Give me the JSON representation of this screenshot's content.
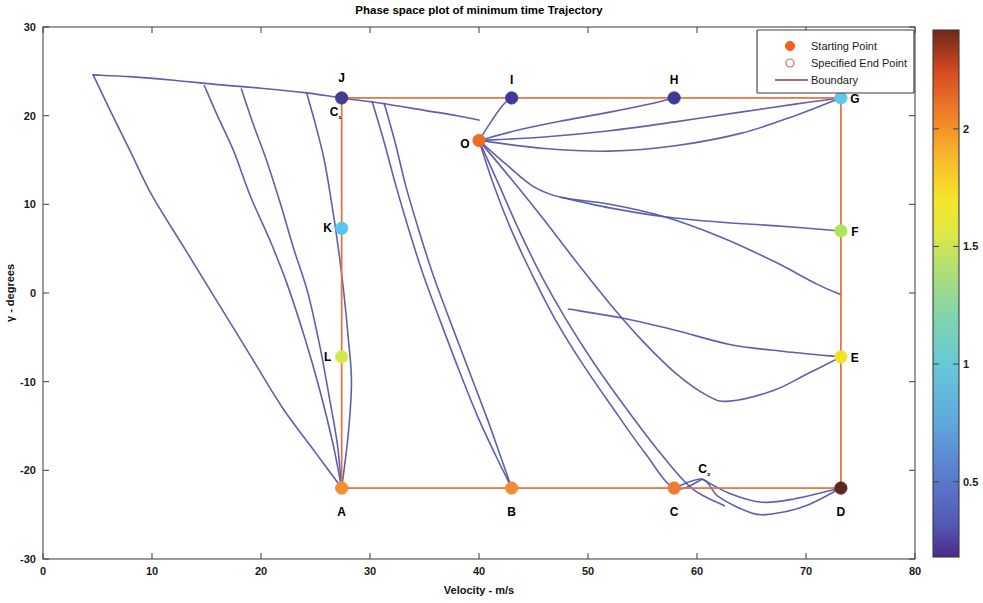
{
  "chart_data": {
    "type": "line",
    "title": "Phase space plot of minimum time Trajectory",
    "xlabel": "Velocity - m/s",
    "ylabel": "γ - degrees",
    "xlim": [
      0,
      80
    ],
    "ylim": [
      -30,
      30
    ],
    "xticks": [
      0,
      10,
      20,
      30,
      40,
      50,
      60,
      70,
      80
    ],
    "yticks": [
      -30,
      -20,
      -10,
      0,
      10,
      20,
      30
    ],
    "xticklabels": [
      "0",
      "10",
      "20",
      "30",
      "40",
      "50",
      "60",
      "70",
      "80"
    ],
    "yticklabels": [
      "-30",
      "-20",
      "-10",
      "0",
      "10",
      "20",
      "30"
    ],
    "grid": false,
    "legend": {
      "position": "top-right",
      "entries": [
        {
          "label": "Starting Point",
          "marker": "filled-circle",
          "color": "#f4601e"
        },
        {
          "label": "Specified End Point",
          "marker": "open-circle",
          "color": "#c86a5a"
        },
        {
          "label": "Boundary",
          "marker": "line",
          "color": "#8b4034"
        }
      ]
    },
    "colorbar": {
      "colormap": "jet",
      "vmin": 0.18,
      "vmax": 2.42,
      "ticks": [
        0.5,
        1,
        1.5,
        2
      ],
      "ticklabels": [
        "0.5",
        "1",
        "1.5",
        "2"
      ],
      "label": ""
    },
    "boundary": {
      "color": "#e8703a",
      "x": [
        27.4,
        73.2
      ],
      "y": [
        -22.0,
        22.0
      ],
      "description": "rectangular boundary from (27.4,-22) to (73.2,22)"
    },
    "annotated_points": [
      {
        "label": "A",
        "x": 27.4,
        "y": -22.0,
        "color": "#f3912e",
        "kind": "starting"
      },
      {
        "label": "B",
        "x": 43.0,
        "y": -22.0,
        "color": "#f08b36",
        "kind": "starting"
      },
      {
        "label": "C",
        "x": 57.9,
        "y": -22.0,
        "color": "#ef7a33",
        "kind": "starting"
      },
      {
        "label": "D",
        "x": 73.2,
        "y": -22.0,
        "color": "#5a2a1c",
        "kind": "end"
      },
      {
        "label": "E",
        "x": 73.2,
        "y": -7.2,
        "color": "#f2e222",
        "kind": "end"
      },
      {
        "label": "F",
        "x": 73.2,
        "y": 7.0,
        "color": "#aee35a",
        "kind": "end"
      },
      {
        "label": "G",
        "x": 73.2,
        "y": 22.0,
        "color": "#5fc7ec",
        "kind": "end"
      },
      {
        "label": "H",
        "x": 57.9,
        "y": 22.0,
        "color": "#3b3a9c",
        "kind": "end"
      },
      {
        "label": "I",
        "x": 43.0,
        "y": 22.0,
        "color": "#3b3a9c",
        "kind": "end"
      },
      {
        "label": "J",
        "x": 27.4,
        "y": 22.0,
        "color": "#3f3d96",
        "kind": "end"
      },
      {
        "label": "K",
        "x": 27.4,
        "y": 7.3,
        "color": "#54c6ef",
        "kind": "end"
      },
      {
        "label": "L",
        "x": 27.4,
        "y": -7.2,
        "color": "#cfe84a",
        "kind": "end"
      },
      {
        "label": "O",
        "x": 40.0,
        "y": 17.2,
        "color": "#ef6a22",
        "kind": "starting"
      },
      {
        "label": "C₁",
        "x": 27.4,
        "y": 22.0,
        "color": "#3f3d96",
        "kind": "corner-annotation"
      },
      {
        "label": "C₂",
        "x": 60.5,
        "y": -21.0,
        "color": "#ef7a33",
        "kind": "corner-annotation"
      }
    ],
    "trajectory_color": "#4f54a8",
    "trajectories": [
      {
        "name": "upper-envelope-to-J",
        "points": [
          [
            4.6,
            24.6
          ],
          [
            8,
            24.4
          ],
          [
            12,
            24.0
          ],
          [
            16,
            23.5
          ],
          [
            20,
            23.1
          ],
          [
            24,
            22.6
          ],
          [
            27.4,
            22.0
          ],
          [
            31,
            21.4
          ],
          [
            35,
            20.6
          ],
          [
            38,
            20.0
          ],
          [
            40,
            19.5
          ]
        ]
      },
      {
        "name": "A-fan-1",
        "points": [
          [
            4.6,
            24.6
          ],
          [
            6,
            21
          ],
          [
            8,
            16
          ],
          [
            10,
            11
          ],
          [
            13,
            5
          ],
          [
            16,
            -1
          ],
          [
            19,
            -7
          ],
          [
            22,
            -13
          ],
          [
            25,
            -18
          ],
          [
            27.4,
            -22.0
          ]
        ]
      },
      {
        "name": "A-fan-2",
        "points": [
          [
            14.8,
            23.4
          ],
          [
            16,
            20
          ],
          [
            17.5,
            16
          ],
          [
            19,
            11
          ],
          [
            20.8,
            6
          ],
          [
            22.4,
            1
          ],
          [
            24,
            -5
          ],
          [
            25.4,
            -11
          ],
          [
            26.6,
            -17
          ],
          [
            27.4,
            -22.0
          ]
        ]
      },
      {
        "name": "A-fan-3",
        "points": [
          [
            18.2,
            23.0
          ],
          [
            19.3,
            19
          ],
          [
            20.5,
            15
          ],
          [
            21.8,
            10
          ],
          [
            23,
            5
          ],
          [
            24.3,
            0
          ],
          [
            25.4,
            -6
          ],
          [
            26.3,
            -12
          ],
          [
            27.0,
            -17
          ],
          [
            27.4,
            -22.0
          ]
        ]
      },
      {
        "name": "A-fan-4",
        "points": [
          [
            24.2,
            22.5
          ],
          [
            25,
            19
          ],
          [
            25.8,
            15
          ],
          [
            26.5,
            10
          ],
          [
            27.1,
            5
          ],
          [
            27.6,
            0
          ],
          [
            28.0,
            -5
          ],
          [
            28.3,
            -10
          ],
          [
            28.0,
            -16
          ],
          [
            27.4,
            -22.0
          ]
        ]
      },
      {
        "name": "B-fan-1",
        "points": [
          [
            30.2,
            21.6
          ],
          [
            31.3,
            17
          ],
          [
            32.4,
            12
          ],
          [
            33.6,
            7
          ],
          [
            34.9,
            2
          ],
          [
            36.4,
            -3
          ],
          [
            38.1,
            -8.5
          ],
          [
            39.9,
            -14
          ],
          [
            41.6,
            -18.5
          ],
          [
            43.0,
            -22.0
          ]
        ]
      },
      {
        "name": "B-fan-2",
        "points": [
          [
            31.3,
            21.4
          ],
          [
            32.3,
            17
          ],
          [
            33.3,
            12
          ],
          [
            34.5,
            7
          ],
          [
            35.8,
            2
          ],
          [
            37.3,
            -3
          ],
          [
            39.0,
            -8.5
          ],
          [
            40.7,
            -14
          ],
          [
            42.0,
            -18.5
          ],
          [
            43.0,
            -22.0
          ]
        ]
      },
      {
        "name": "O-to-C-steep",
        "points": [
          [
            40.0,
            17.2
          ],
          [
            41.4,
            12
          ],
          [
            43.0,
            7
          ],
          [
            44.9,
            2
          ],
          [
            47.0,
            -3
          ],
          [
            49.5,
            -8
          ],
          [
            52.3,
            -13
          ],
          [
            55.2,
            -18
          ],
          [
            57.9,
            -22.0
          ],
          [
            60.5,
            -21.0
          ]
        ]
      },
      {
        "name": "O-to-D-steep",
        "points": [
          [
            40.0,
            17.2
          ],
          [
            41.9,
            12
          ],
          [
            43.7,
            7
          ],
          [
            45.7,
            2
          ],
          [
            48.0,
            -3
          ],
          [
            50.6,
            -8
          ],
          [
            53.5,
            -13
          ],
          [
            56.6,
            -18
          ],
          [
            59.5,
            -22.0
          ],
          [
            62.5,
            -24.0
          ]
        ]
      },
      {
        "name": "O-up-to-I",
        "points": [
          [
            40.0,
            17.2
          ],
          [
            41.2,
            19.5
          ],
          [
            42.2,
            21.2
          ],
          [
            43.0,
            22.0
          ]
        ]
      },
      {
        "name": "O-up-to-H",
        "points": [
          [
            40.0,
            17.2
          ],
          [
            44,
            18.5
          ],
          [
            48,
            19.5
          ],
          [
            52,
            20.4
          ],
          [
            56,
            21.4
          ],
          [
            57.9,
            22.0
          ]
        ]
      },
      {
        "name": "O-right-to-G",
        "points": [
          [
            40.0,
            17.2
          ],
          [
            46,
            17.6
          ],
          [
            52,
            18.3
          ],
          [
            58,
            19.3
          ],
          [
            64,
            20.4
          ],
          [
            69,
            21.3
          ],
          [
            73.2,
            22.0
          ]
        ]
      },
      {
        "name": "O-mid-to-G",
        "points": [
          [
            40.0,
            17.2
          ],
          [
            46,
            16.3
          ],
          [
            52,
            16.0
          ],
          [
            58,
            16.6
          ],
          [
            64,
            18.0
          ],
          [
            69,
            20.0
          ],
          [
            73.2,
            22.0
          ]
        ]
      },
      {
        "name": "branch-F-upper",
        "points": [
          [
            40.0,
            17.2
          ],
          [
            42.5,
            14.5
          ],
          [
            45,
            12.0
          ],
          [
            47.5,
            10.8
          ],
          [
            52,
            10.0
          ],
          [
            57,
            8.6
          ],
          [
            62,
            6.4
          ],
          [
            67,
            3.6
          ],
          [
            71,
            1.0
          ],
          [
            73.2,
            -0.2
          ]
        ]
      },
      {
        "name": "branch-to-F",
        "points": [
          [
            47.5,
            10.8
          ],
          [
            52,
            9.6
          ],
          [
            57,
            8.6
          ],
          [
            62,
            8.0
          ],
          [
            67,
            7.6
          ],
          [
            73.2,
            7.0
          ]
        ]
      },
      {
        "name": "branch-E-upper",
        "points": [
          [
            40.0,
            17.2
          ],
          [
            43,
            12.8
          ],
          [
            46,
            8.2
          ],
          [
            49,
            3.4
          ],
          [
            52,
            -1.2
          ],
          [
            55,
            -5.4
          ],
          [
            58,
            -9.0
          ],
          [
            61,
            -11.6
          ],
          [
            63,
            -12.2
          ],
          [
            67,
            -11.0
          ],
          [
            70,
            -9.2
          ],
          [
            73.2,
            -7.2
          ]
        ]
      },
      {
        "name": "branch-mid-F2",
        "points": [
          [
            48.2,
            -1.8
          ],
          [
            53,
            -2.8
          ],
          [
            58,
            -4.2
          ],
          [
            63,
            -5.8
          ],
          [
            68,
            -6.6
          ],
          [
            73.2,
            -7.2
          ]
        ]
      },
      {
        "name": "lower-to-D",
        "points": [
          [
            57.9,
            -22.0
          ],
          [
            60.5,
            -21.0
          ],
          [
            62,
            -23.0
          ],
          [
            65,
            -24.8
          ],
          [
            67,
            -24.9
          ],
          [
            70,
            -24.0
          ],
          [
            73.2,
            -22.0
          ]
        ]
      },
      {
        "name": "C2-branch",
        "points": [
          [
            60.5,
            -21.0
          ],
          [
            63,
            -22.6
          ],
          [
            66,
            -23.6
          ],
          [
            69,
            -23.2
          ],
          [
            73.2,
            -22.0
          ]
        ]
      }
    ]
  }
}
